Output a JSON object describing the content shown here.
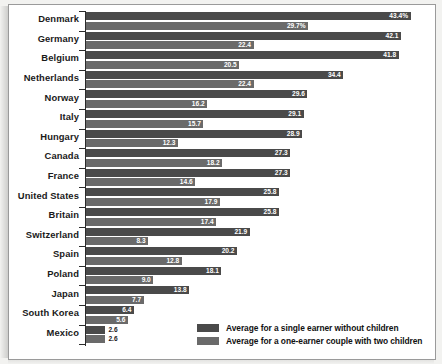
{
  "chart_data": {
    "type": "bar",
    "orientation": "horizontal",
    "title": "",
    "xlabel": "",
    "ylabel": "",
    "grid": false,
    "legend_position": "bottom-right",
    "xlim": [
      0,
      46
    ],
    "categories": [
      "Denmark",
      "Germany",
      "Belgium",
      "Netherlands",
      "Norway",
      "Italy",
      "Hungary",
      "Canada",
      "France",
      "United States",
      "Britain",
      "Switzerland",
      "Spain",
      "Poland",
      "Japan",
      "South Korea",
      "Mexico"
    ],
    "series": [
      {
        "name": "Average for a single earner without children",
        "color": "#4a4a4a",
        "values": [
          43.4,
          42.1,
          41.8,
          34.4,
          29.6,
          29.1,
          28.9,
          27.3,
          27.3,
          25.8,
          25.8,
          21.9,
          20.2,
          18.1,
          13.8,
          6.4,
          2.6
        ],
        "labels": [
          "43.4%",
          "42.1",
          "41.8",
          "34.4",
          "29.6",
          "29.1",
          "28.9",
          "27.3",
          "27.3",
          "25.8",
          "25.8",
          "21.9",
          "20.2",
          "18.1",
          "13.8",
          "6.4",
          "2.6"
        ]
      },
      {
        "name": "Average for a one-earner couple with two children",
        "color": "#6a6a6a",
        "values": [
          29.7,
          22.4,
          20.5,
          22.4,
          16.2,
          15.7,
          12.3,
          18.2,
          14.6,
          17.9,
          17.4,
          8.3,
          12.8,
          9.0,
          7.7,
          5.6,
          2.6
        ],
        "labels": [
          "29.7%",
          "22.4",
          "20.5",
          "22.4",
          "16.2",
          "15.7",
          "12.3",
          "18.2",
          "14.6",
          "17.9",
          "17.4",
          "8.3",
          "12.8",
          "9.0",
          "7.7",
          "5.6",
          "2.6"
        ]
      }
    ]
  },
  "legend": {
    "items": [
      {
        "label": "Average for a single earner without children"
      },
      {
        "label": "Average for a one-earner couple with two children"
      }
    ]
  }
}
